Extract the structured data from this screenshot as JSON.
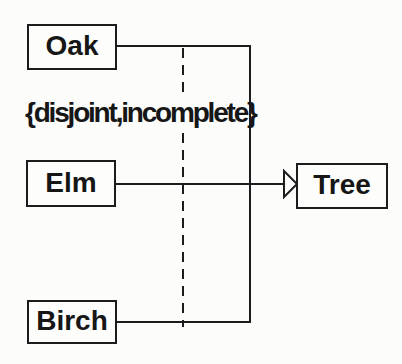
{
  "diagram": {
    "kind": "uml-generalization",
    "constraint": {
      "text": "{disjoint,incomplete}"
    },
    "superclass": {
      "label": "Tree"
    },
    "subclasses": [
      {
        "label": "Oak"
      },
      {
        "label": "Elm"
      },
      {
        "label": "Birch"
      }
    ],
    "relationship": {
      "type": "generalization",
      "arrowhead": "hollow-triangle",
      "shared_target_line": "dashed"
    },
    "colors": {
      "line": "#1c1c1c",
      "background": "#fcfcfa",
      "box_fill": "#fdfdfc",
      "text": "#161616"
    }
  }
}
